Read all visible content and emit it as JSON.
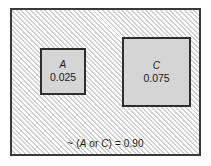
{
  "figure": {
    "type": "venn-probability-diagram",
    "universe": {
      "name": "sample-space",
      "fill": "hatched",
      "border_color": "#3a3a3a"
    },
    "events": [
      {
        "id": "a",
        "label": "A",
        "value": "0.025",
        "fill_color": "#d5d5d5",
        "border_color": "#2e2e2e"
      },
      {
        "id": "c",
        "label": "C",
        "value": "0.075",
        "fill_color": "#d5d5d5",
        "border_color": "#2e2e2e"
      }
    ],
    "annotation": {
      "prefix": "~",
      "open_paren": "(",
      "first_term": "A",
      "operator": "or",
      "second_term": "C",
      "close_paren": ")",
      "equals": "=",
      "value": "0.90",
      "full_text": "~ (A or C) = 0.90"
    }
  }
}
